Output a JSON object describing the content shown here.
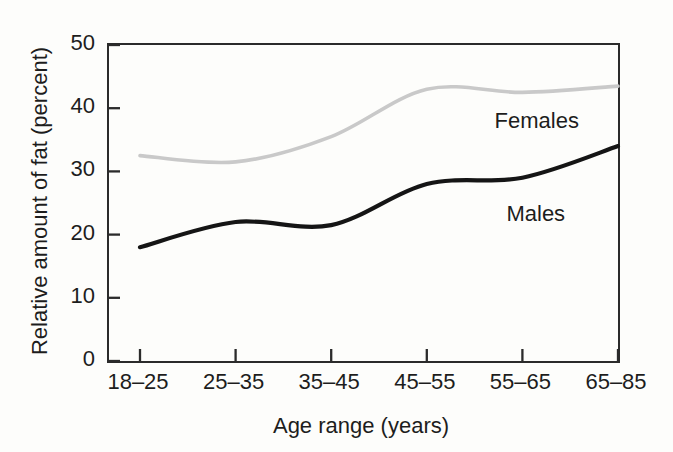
{
  "figure": {
    "background": "#fdfdfb",
    "axis_color": "#2b2b2b",
    "text_color": "#1d1d1d"
  },
  "chart_data": {
    "type": "line",
    "title": "",
    "xlabel": "Age range (years)",
    "ylabel": "Relative amount of fat (percent)",
    "categories": [
      "18–25",
      "25–35",
      "35–45",
      "45–55",
      "55–65",
      "65–85"
    ],
    "series": [
      {
        "name": "Females",
        "color": "#c9c9c9",
        "line_width": 3.6,
        "values": [
          32.5,
          31.5,
          35.5,
          43,
          42.5,
          43.5
        ]
      },
      {
        "name": "Males",
        "color": "#151515",
        "line_width": 4.2,
        "values": [
          18,
          22,
          21.5,
          28,
          29,
          34
        ]
      }
    ],
    "ylim": [
      0,
      50
    ],
    "yticks": [
      0,
      10,
      20,
      30,
      40,
      50
    ],
    "grid": false,
    "legend_position": "inline-annotations",
    "annotations": [
      {
        "text": "Females",
        "x": 4.15,
        "y": 38.0
      },
      {
        "text": "Males",
        "x": 4.14,
        "y": 23.2
      }
    ]
  }
}
